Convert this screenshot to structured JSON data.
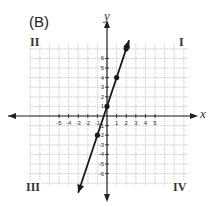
{
  "panel_label": "(B)",
  "quadrants": {
    "I": "I",
    "II": "II",
    "III": "III",
    "IV": "IV"
  },
  "axes": {
    "x_label": "x",
    "y_label": "y"
  },
  "chart_data": {
    "type": "line",
    "title": "(B)",
    "xlabel": "x",
    "ylabel": "y",
    "xlim": [
      -8,
      8
    ],
    "ylim": [
      -7,
      7
    ],
    "grid": true,
    "x_tick_labels": [
      "-5",
      "-4",
      "-3",
      "-2",
      "-1",
      "1",
      "2",
      "3",
      "4",
      "5"
    ],
    "y_tick_labels": [
      "6",
      "5",
      "4",
      "3",
      "2",
      "1",
      "-1",
      "-2",
      "-3",
      "-4",
      "-5",
      "-6"
    ],
    "series": [
      {
        "name": "y = 3x + 1",
        "points": [
          [
            -1,
            -2
          ],
          [
            0,
            1
          ],
          [
            1,
            4
          ],
          [
            2,
            7
          ]
        ],
        "line_extent": [
          [
            -3,
            -8
          ],
          [
            2.3,
            7.9
          ]
        ],
        "color": "#1a1a1a"
      }
    ],
    "annotations": [
      "I",
      "II",
      "III",
      "IV"
    ]
  },
  "colors": {
    "grid": "#9a9a9a",
    "axis": "#222222",
    "line": "#1a1a1a"
  }
}
